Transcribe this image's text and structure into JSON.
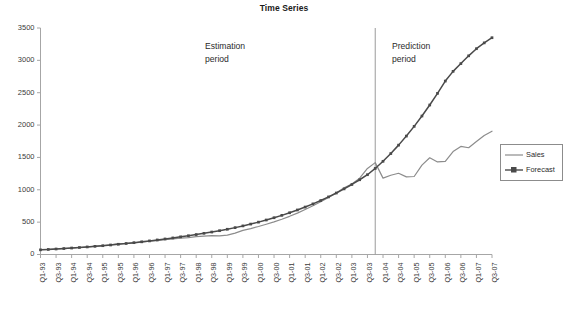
{
  "chart_data": {
    "type": "line",
    "title": "Time Series",
    "xlabel": "",
    "ylabel": "",
    "ylim": [
      0,
      3500
    ],
    "yticks": [
      0,
      500,
      1000,
      1500,
      2000,
      2500,
      3000,
      3500
    ],
    "grid": false,
    "legend_position": "right",
    "x": [
      "Q1-93",
      "Q2-93",
      "Q3-93",
      "Q4-93",
      "Q1-94",
      "Q2-94",
      "Q3-94",
      "Q4-94",
      "Q1-95",
      "Q2-95",
      "Q3-95",
      "Q4-95",
      "Q1-96",
      "Q2-96",
      "Q3-96",
      "Q4-96",
      "Q1-97",
      "Q2-97",
      "Q3-97",
      "Q4-97",
      "Q1-98",
      "Q2-98",
      "Q3-98",
      "Q4-98",
      "Q1-99",
      "Q2-99",
      "Q3-99",
      "Q4-99",
      "Q1-00",
      "Q2-00",
      "Q3-00",
      "Q4-00",
      "Q1-01",
      "Q2-01",
      "Q3-01",
      "Q4-01",
      "Q1-02",
      "Q2-02",
      "Q3-02",
      "Q4-02",
      "Q1-03",
      "Q2-03",
      "Q3-03",
      "Q4-03",
      "Q1-04",
      "Q2-04",
      "Q3-04",
      "Q4-04",
      "Q1-05",
      "Q2-05",
      "Q3-05",
      "Q4-05",
      "Q1-06",
      "Q2-06",
      "Q3-06",
      "Q4-06",
      "Q1-07",
      "Q2-07",
      "Q3-07"
    ],
    "xtick_labels": [
      "Q1-93",
      "Q3-93",
      "Q1-94",
      "Q3-94",
      "Q1-95",
      "Q3-95",
      "Q1-96",
      "Q3-96",
      "Q1-97",
      "Q3-97",
      "Q1-98",
      "Q3-98",
      "Q1-99",
      "Q3-99",
      "Q1-00",
      "Q3-00",
      "Q1-01",
      "Q3-01",
      "Q1-02",
      "Q3-02",
      "Q1-03",
      "Q3-03",
      "Q1-04",
      "Q3-04",
      "Q1-05",
      "Q3-05",
      "Q1-06",
      "Q3-06",
      "Q1-07",
      "Q3-07"
    ],
    "series": [
      {
        "name": "Sales",
        "marker": "none",
        "color": "#8c8c8c",
        "values": [
          75,
          80,
          88,
          92,
          100,
          108,
          118,
          126,
          136,
          150,
          168,
          172,
          180,
          192,
          205,
          215,
          228,
          240,
          252,
          262,
          275,
          285,
          292,
          288,
          300,
          330,
          372,
          400,
          432,
          468,
          505,
          545,
          590,
          640,
          695,
          752,
          815,
          880,
          952,
          1030,
          1090,
          1180,
          1330,
          1420,
          1180,
          1225,
          1255,
          1200,
          1205,
          1380,
          1495,
          1430,
          1440,
          1590,
          1670,
          1650,
          1745,
          1840,
          1905
        ]
      },
      {
        "name": "Forecast",
        "marker": "square",
        "color": "#4a4a4a",
        "values": [
          72,
          78,
          85,
          92,
          100,
          108,
          117,
          126,
          136,
          147,
          158,
          170,
          183,
          196,
          210,
          225,
          240,
          256,
          273,
          290,
          308,
          327,
          347,
          368,
          390,
          415,
          442,
          470,
          500,
          533,
          568,
          605,
          645,
          688,
          733,
          782,
          834,
          890,
          950,
          1014,
          1082,
          1155,
          1233,
          1330,
          1440,
          1560,
          1690,
          1830,
          1980,
          2140,
          2310,
          2490,
          2680,
          2830,
          2950,
          3070,
          3180,
          3270,
          3350
        ]
      }
    ],
    "annotations": [
      {
        "text_line1": "Estimation",
        "text_line2": "period"
      },
      {
        "text_line1": "Prediction",
        "text_line2": "period"
      }
    ],
    "divider_at": "Q4-03"
  },
  "legend": {
    "entries": [
      {
        "label": "Sales"
      },
      {
        "label": "Forecast"
      }
    ]
  }
}
